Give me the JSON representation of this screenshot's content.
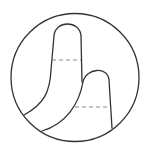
{
  "diagram": {
    "colors": {
      "line": "#333333",
      "dashed": "#8a8a8a",
      "background": "#ffffff"
    },
    "elements": [
      {
        "name": "outer-circle",
        "style": "solid"
      },
      {
        "name": "lobe-1",
        "style": "solid"
      },
      {
        "name": "lobe-2",
        "style": "solid"
      },
      {
        "name": "dashed-line-1",
        "style": "dashed"
      },
      {
        "name": "dashed-line-2",
        "style": "dashed"
      }
    ]
  }
}
